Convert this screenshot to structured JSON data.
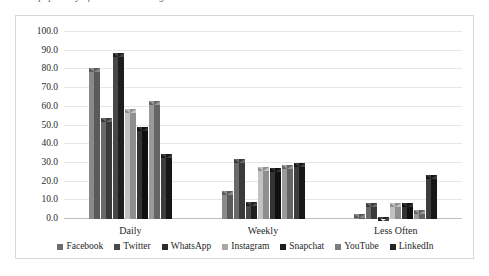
{
  "caption": {
    "clipped_text": "the popularity of social networking sites"
  },
  "chart_data": {
    "type": "bar",
    "title": "",
    "subtitle": "",
    "xlabel": "",
    "ylabel": "",
    "categories": [
      "Daily",
      "Weekly",
      "Less Often"
    ],
    "ylim": [
      0,
      100
    ],
    "ytick_step": 10,
    "ytick_labels": [
      "100.0",
      "90.0",
      "80.0",
      "70.0",
      "60.0",
      "50.0",
      "40.0",
      "30.0",
      "20.0",
      "10.0",
      "0.0"
    ],
    "ytick_values": [
      100,
      90,
      80,
      70,
      60,
      50,
      40,
      30,
      20,
      10,
      0
    ],
    "grid": true,
    "legend_position": "bottom",
    "bar_style": "3d-clustered",
    "series": [
      {
        "name": "Facebook",
        "color": "#6e6e6e",
        "color_left": "#8a8a8a",
        "color_right": "#5a5a5a",
        "values": [
          81.0,
          15.0,
          2.5
        ]
      },
      {
        "name": "Twitter",
        "color": "#4a4a4a",
        "color_left": "#6a6a6a",
        "color_right": "#3a3a3a",
        "values": [
          54.0,
          32.0,
          8.5
        ]
      },
      {
        "name": "WhatsApp",
        "color": "#2b2b2b",
        "color_left": "#474747",
        "color_right": "#1e1e1e",
        "values": [
          89.0,
          9.0,
          1.0
        ]
      },
      {
        "name": "Instagram",
        "color": "#a8a8a8",
        "color_left": "#c2c2c2",
        "color_right": "#8f8f8f",
        "values": [
          59.0,
          28.0,
          8.5
        ]
      },
      {
        "name": "Snapchat",
        "color": "#1c1c1c",
        "color_left": "#333333",
        "color_right": "#101010",
        "values": [
          49.0,
          27.5,
          8.5
        ]
      },
      {
        "name": "YouTube",
        "color": "#7d7d7d",
        "color_left": "#9a9a9a",
        "color_right": "#656565",
        "values": [
          63.0,
          29.0,
          5.0
        ]
      },
      {
        "name": "LinkedIn",
        "color": "#242424",
        "color_left": "#3d3d3d",
        "color_right": "#171717",
        "values": [
          35.0,
          30.0,
          23.5
        ]
      }
    ]
  }
}
